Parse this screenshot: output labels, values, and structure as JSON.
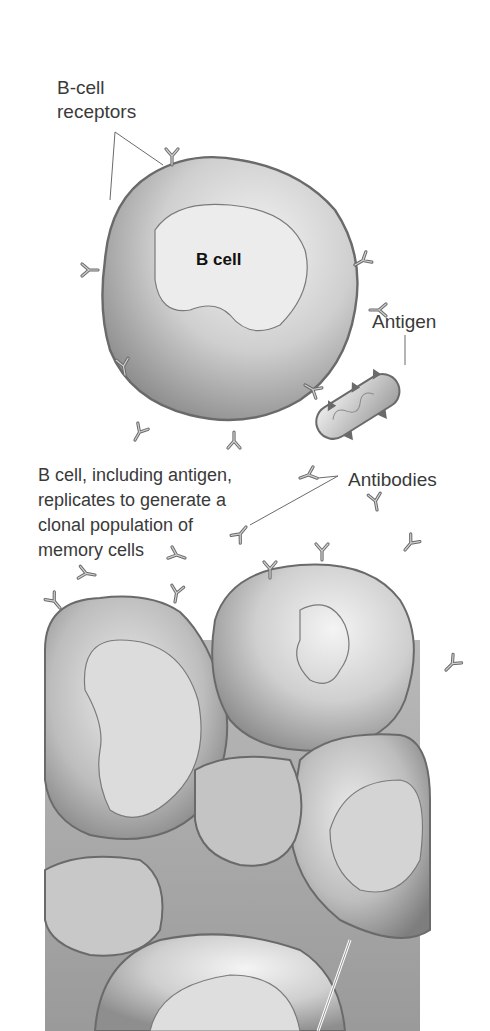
{
  "diagram": {
    "labels": {
      "receptors": "B-cell\nreceptors",
      "b_cell": "B cell",
      "antigen": "Antigen",
      "replication": "B cell, including antigen,\nreplicates to generate a\nclonal population of\nmemory cells",
      "antibodies": "Antibodies"
    },
    "colors": {
      "background": "#ffffff",
      "cell_fill": "#d9d9d9",
      "cell_shadow": "#9a9a9a",
      "outline": "#6a6a6a",
      "text": "#3a3a3a"
    }
  }
}
